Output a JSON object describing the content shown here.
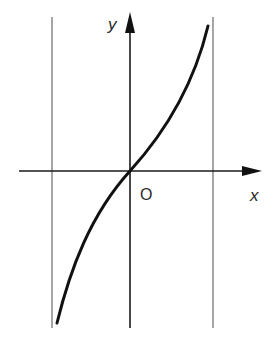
{
  "diagram": {
    "axes": {
      "x_label": "x",
      "y_label": "y",
      "origin_label": "O"
    },
    "asymptotes": [
      {
        "name": "left-asymptote",
        "x_px": 52
      },
      {
        "name": "right-asymptote",
        "x_px": 213
      }
    ],
    "colors": {
      "curve": "#111111",
      "axes": "#1a1a1a",
      "asymptotes": "#6a6a6a",
      "background": "#ffffff"
    }
  }
}
